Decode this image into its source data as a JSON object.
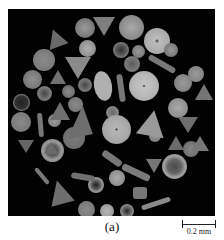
{
  "figure": {
    "caption": "(a)",
    "scale_bar_label": "0.2 mm",
    "background": "#020202"
  }
}
